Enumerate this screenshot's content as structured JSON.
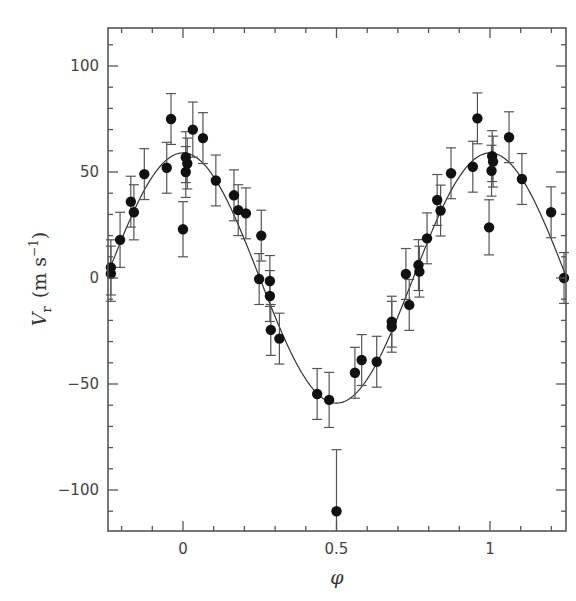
{
  "chart_data": {
    "type": "scatter",
    "title": "",
    "xlabel": "φ",
    "ylabel": "V_r (m s^-1)",
    "ylabel_parts": {
      "symbol": "V",
      "subscript": "r",
      "units": "(m s",
      "exponent": "−1",
      "close": ")"
    },
    "xlim": [
      -0.245,
      1.25
    ],
    "ylim": [
      -119,
      118
    ],
    "x_ticks": [
      0,
      0.5,
      1
    ],
    "x_tick_labels": [
      "0",
      "0.5",
      "1"
    ],
    "x_minor_step": 0.1,
    "y_ticks": [
      -100,
      -50,
      0,
      50,
      100
    ],
    "y_tick_labels": [
      "−100",
      "−50",
      "0",
      "50",
      "100"
    ],
    "y_minor_step": 10,
    "grid": false,
    "legend": null,
    "series": [
      {
        "name": "Radial velocity measurements",
        "kind": "points_with_errorbars",
        "points": [
          {
            "x": -0.235,
            "y": 5,
            "err": 13
          },
          {
            "x": -0.235,
            "y": 2,
            "err": 13
          },
          {
            "x": -0.205,
            "y": 18,
            "err": 13
          },
          {
            "x": -0.17,
            "y": 36,
            "err": 12
          },
          {
            "x": -0.16,
            "y": 31,
            "err": 13
          },
          {
            "x": -0.126,
            "y": 49,
            "err": 12
          },
          {
            "x": -0.053,
            "y": 52,
            "err": 12
          },
          {
            "x": -0.039,
            "y": 75,
            "err": 12
          },
          {
            "x": 0.0,
            "y": 23,
            "err": 13
          },
          {
            "x": 0.009,
            "y": 57,
            "err": 12
          },
          {
            "x": 0.014,
            "y": 54,
            "err": 12
          },
          {
            "x": 0.009,
            "y": 50,
            "err": 12
          },
          {
            "x": 0.032,
            "y": 70,
            "err": 13
          },
          {
            "x": 0.065,
            "y": 66,
            "err": 12
          },
          {
            "x": 0.107,
            "y": 46,
            "err": 12
          },
          {
            "x": 0.166,
            "y": 39,
            "err": 12
          },
          {
            "x": 0.18,
            "y": 32,
            "err": 12
          },
          {
            "x": 0.205,
            "y": 30.5,
            "err": 12
          },
          {
            "x": 0.255,
            "y": 20,
            "err": 12
          },
          {
            "x": 0.248,
            "y": -0.5,
            "err": 12
          },
          {
            "x": 0.283,
            "y": -1.4,
            "err": 12
          },
          {
            "x": 0.283,
            "y": -8.5,
            "err": 12
          },
          {
            "x": 0.286,
            "y": -24.5,
            "err": 12
          },
          {
            "x": 0.314,
            "y": -28.6,
            "err": 12
          },
          {
            "x": 0.437,
            "y": -54.7,
            "err": 12
          },
          {
            "x": 0.476,
            "y": -57.5,
            "err": 13
          },
          {
            "x": 0.5,
            "y": -110,
            "err": 29
          },
          {
            "x": 0.56,
            "y": -44.7,
            "err": 12
          },
          {
            "x": 0.582,
            "y": -38.7,
            "err": 12
          },
          {
            "x": 0.631,
            "y": -39.5,
            "err": 12
          },
          {
            "x": 0.68,
            "y": -20.6,
            "err": 12
          },
          {
            "x": 0.68,
            "y": -23,
            "err": 12
          },
          {
            "x": 0.726,
            "y": 1.9,
            "err": 12
          },
          {
            "x": 0.737,
            "y": -12.7,
            "err": 12
          },
          {
            "x": 0.767,
            "y": 6.1,
            "err": 12
          },
          {
            "x": 0.77,
            "y": 3,
            "err": 12
          },
          {
            "x": 0.795,
            "y": 18.7,
            "err": 12
          },
          {
            "x": 0.828,
            "y": 36.8,
            "err": 12
          },
          {
            "x": 0.839,
            "y": 31.8,
            "err": 12
          },
          {
            "x": 0.873,
            "y": 49.4,
            "err": 12
          },
          {
            "x": 0.944,
            "y": 52.5,
            "err": 12
          },
          {
            "x": 0.959,
            "y": 75.3,
            "err": 12
          },
          {
            "x": 0.997,
            "y": 23.9,
            "err": 13
          },
          {
            "x": 1.007,
            "y": 57.5,
            "err": 12
          },
          {
            "x": 1.01,
            "y": 54.9,
            "err": 12
          },
          {
            "x": 1.005,
            "y": 50.6,
            "err": 12
          },
          {
            "x": 1.062,
            "y": 66.4,
            "err": 12
          },
          {
            "x": 1.104,
            "y": 46.7,
            "err": 12
          },
          {
            "x": 1.199,
            "y": 31,
            "err": 12
          },
          {
            "x": 1.241,
            "y": 0,
            "err": 12
          }
        ]
      },
      {
        "name": "Orbital fit",
        "kind": "curve",
        "function": "K*cos(2*pi*phi)",
        "K": 59
      }
    ]
  },
  "style": {
    "axis_color": "#555555",
    "point_color": "#111111",
    "errorbar_color": "#555555",
    "curve_color": "#333333"
  }
}
